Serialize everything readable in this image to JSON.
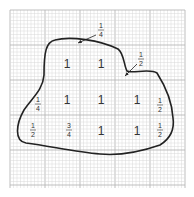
{
  "grid": {
    "x0": 10,
    "y0": 10,
    "x1": 185,
    "y1": 188,
    "minor": 3.5,
    "major": 35,
    "minor_color": "#d8d8d8",
    "major_color": "#b8b8b8"
  },
  "labels": [
    {
      "text": "1",
      "x": 67,
      "y": 68,
      "kind": "whole"
    },
    {
      "text": "1",
      "x": 101,
      "y": 68,
      "kind": "whole"
    },
    {
      "text": "1",
      "x": 67,
      "y": 104,
      "kind": "whole"
    },
    {
      "text": "1",
      "x": 101,
      "y": 104,
      "kind": "whole"
    },
    {
      "text": "1",
      "x": 137,
      "y": 104,
      "kind": "whole"
    },
    {
      "text": "1",
      "x": 101,
      "y": 135,
      "kind": "whole"
    },
    {
      "text": "1",
      "x": 137,
      "y": 135,
      "kind": "whole"
    },
    {
      "num": "1",
      "den": "4",
      "x": 101,
      "y": 30,
      "kind": "frac"
    },
    {
      "num": "1",
      "den": "2",
      "x": 141,
      "y": 59,
      "kind": "frac"
    },
    {
      "num": "1",
      "den": "4",
      "x": 38,
      "y": 104,
      "kind": "frac"
    },
    {
      "num": "1",
      "den": "2",
      "x": 160,
      "y": 105,
      "kind": "frac"
    },
    {
      "num": "1",
      "den": "2",
      "x": 33,
      "y": 130,
      "kind": "frac"
    },
    {
      "num": "3",
      "den": "4",
      "x": 69,
      "y": 130,
      "kind": "frac"
    },
    {
      "num": "1",
      "den": "2",
      "x": 160,
      "y": 130,
      "kind": "frac"
    }
  ],
  "arrows": [
    {
      "from": [
        96,
        35
      ],
      "to": [
        78,
        43
      ]
    },
    {
      "from": [
        137,
        64
      ],
      "to": [
        125,
        76
      ]
    }
  ],
  "shape_path": "M44,75 C44,52 46,42 55,40 C70,36 100,40 118,49 C124,53 124,66 127,71 C131,74 150,68 157,73 C164,84 172,100 173,118 C175,132 168,140 160,145 C140,152 122,156 100,154 C75,152 50,146 26,143 C14,141 16,124 24,110 C32,98 43,90 44,75 Z",
  "colors": {
    "stroke": "#222222",
    "text": "#333333"
  }
}
